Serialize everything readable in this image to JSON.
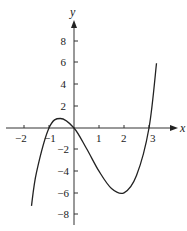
{
  "chart_data": {
    "type": "line",
    "title": "",
    "xlabel": "x",
    "ylabel": "y",
    "function": "y = x^3 - 2x^2 - 3x",
    "xlim": [
      -2.3,
      3.7
    ],
    "ylim": [
      -9,
      10
    ],
    "x_ticks": [
      -2,
      -1,
      1,
      2,
      3
    ],
    "x_tick_labels": [
      "-2",
      "-1",
      "1",
      "2",
      "3"
    ],
    "y_ticks": [
      8,
      6,
      4,
      2,
      -2,
      -4,
      -6,
      -8
    ],
    "y_tick_labels": [
      "8",
      "6",
      "4",
      "2",
      "-2",
      "-4",
      "-6",
      "-8"
    ],
    "grid": false,
    "series": [
      {
        "name": "curve",
        "x": [
          -1.7,
          -1.5,
          -1,
          -0.55,
          0,
          0.5,
          1,
          1.5,
          2,
          2.5,
          3,
          3.3
        ],
        "y": [
          -7.2,
          -4.1,
          0,
          0.88,
          0,
          -1.9,
          -4,
          -5.6,
          -6,
          -4.4,
          0,
          6.0
        ]
      }
    ],
    "key_points": {
      "x_intercepts": [
        -1,
        0,
        3
      ],
      "local_max": [
        -0.55,
        0.88
      ],
      "local_min": [
        2,
        -6
      ]
    }
  },
  "labels": {
    "x_axis": "x",
    "y_axis": "y",
    "xt": [
      "−2",
      "−1",
      "1",
      "2",
      "3"
    ],
    "yt": [
      "8",
      "6",
      "4",
      "2",
      "−2",
      "−4",
      "−6",
      "−8"
    ]
  }
}
